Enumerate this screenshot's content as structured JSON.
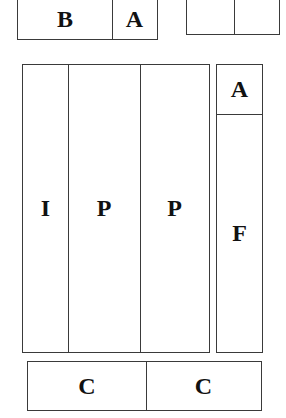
{
  "diagram": {
    "top_left_box": {
      "cells": [
        "B",
        "A"
      ]
    },
    "top_right_box": {
      "cells": [
        "",
        ""
      ]
    },
    "main_box": {
      "cells": [
        "I",
        "P",
        "P"
      ]
    },
    "right_box": {
      "cells": [
        "A",
        "F"
      ]
    },
    "bottom_box": {
      "cells": [
        "C",
        "C"
      ]
    },
    "line_color": "#3a3a3a",
    "text_color": "#111111"
  }
}
